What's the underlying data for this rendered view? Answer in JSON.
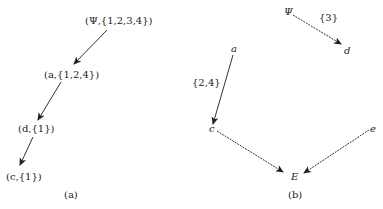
{
  "panel_a": {
    "caption": "(a)",
    "nodes": [
      {
        "id": "root",
        "label": "(Ψ,{1,2,3,4})"
      },
      {
        "id": "a",
        "label": "(a,{1,2,4})"
      },
      {
        "id": "d",
        "label": "(d,{1})"
      },
      {
        "id": "c",
        "label": "(c,{1})"
      }
    ],
    "edges": [
      {
        "from": "root",
        "to": "a",
        "style": "solid"
      },
      {
        "from": "a",
        "to": "d",
        "style": "solid"
      },
      {
        "from": "d",
        "to": "c",
        "style": "solid"
      }
    ]
  },
  "panel_b": {
    "caption": "(b)",
    "nodes": [
      {
        "id": "psi",
        "label": "Ψ"
      },
      {
        "id": "d",
        "label": "d"
      },
      {
        "id": "a",
        "label": "a"
      },
      {
        "id": "c",
        "label": "c"
      },
      {
        "id": "e",
        "label": "e"
      },
      {
        "id": "E",
        "label": "E"
      }
    ],
    "edges": [
      {
        "from": "psi",
        "to": "d",
        "style": "dashed",
        "label": "{3}"
      },
      {
        "from": "a",
        "to": "c",
        "style": "solid",
        "label": "{2,4}"
      },
      {
        "from": "c",
        "to": "E",
        "style": "dashed"
      },
      {
        "from": "e",
        "to": "E",
        "style": "dashed"
      }
    ]
  },
  "colors": {
    "stroke": "#333333",
    "text": "#222222",
    "background": "#ffffff"
  }
}
